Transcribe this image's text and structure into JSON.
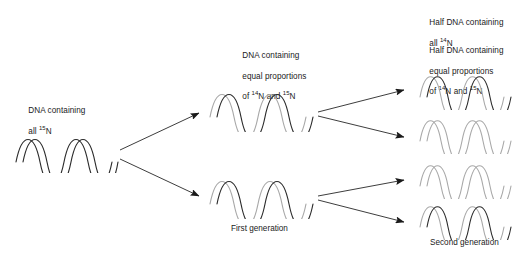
{
  "diagram": {
    "width": 528,
    "height": 259,
    "background": "#ffffff",
    "strand_colors": {
      "old_heavy_15n": "#2b2b2b",
      "new_light_14n": "#a8a8a8"
    }
  },
  "labels": {
    "parental": {
      "line1": "DNA containing",
      "line2_prefix": "all ",
      "line2_sup": "15",
      "line2_suffix": "N"
    },
    "first_generation_desc": {
      "line1": "DNA containing",
      "line2": "equal proportions",
      "line3_prefix": "of ",
      "line3_sup1": "14",
      "line3_mid": "N and ",
      "line3_sup2": "15",
      "line3_suffix": "N"
    },
    "second_generation_desc_a": {
      "line1": "Half DNA containing",
      "line2_prefix": "all ",
      "line2_sup": "14",
      "line2_suffix": "N"
    },
    "second_generation_desc_b": {
      "line1": "Half DNA containing",
      "line2": "equal proportions",
      "line3_prefix": "of ",
      "line3_sup1": "14",
      "line3_mid": "N and ",
      "line3_sup2": "15",
      "line3_suffix": "N"
    },
    "first_generation_caption": "First generation",
    "second_generation_caption": "Second generation"
  },
  "molecules": [
    {
      "id": "parental-dna",
      "name": "parental-dna-helix",
      "generation": "parental",
      "strands": [
        "old",
        "old"
      ],
      "composition": "all 15N"
    },
    {
      "id": "gen1-dna-top",
      "name": "first-generation-dna-upper",
      "generation": "first",
      "strands": [
        "new",
        "old"
      ],
      "composition": "equal proportions 14N and 15N"
    },
    {
      "id": "gen1-dna-bottom",
      "name": "first-generation-dna-lower",
      "generation": "first",
      "strands": [
        "new",
        "old"
      ],
      "composition": "equal proportions 14N and 15N"
    },
    {
      "id": "gen2-dna-1",
      "name": "second-generation-dna-1",
      "generation": "second",
      "strands": [
        "new",
        "old"
      ],
      "composition": "equal proportions 14N and 15N"
    },
    {
      "id": "gen2-dna-2",
      "name": "second-generation-dna-2",
      "generation": "second",
      "strands": [
        "new",
        "new"
      ],
      "composition": "all 14N"
    },
    {
      "id": "gen2-dna-3",
      "name": "second-generation-dna-3",
      "generation": "second",
      "strands": [
        "new",
        "new"
      ],
      "composition": "all 14N"
    },
    {
      "id": "gen2-dna-4",
      "name": "second-generation-dna-4",
      "generation": "second",
      "strands": [
        "new",
        "old"
      ],
      "composition": "equal proportions 14N and 15N"
    }
  ],
  "arrows": [
    {
      "id": "arrow-parent-to-gen1-top",
      "from": "parental-dna",
      "to": "gen1-dna-top"
    },
    {
      "id": "arrow-parent-to-gen1-bottom",
      "from": "parental-dna",
      "to": "gen1-dna-bottom"
    },
    {
      "id": "arrow-gen1top-to-gen2-1",
      "from": "gen1-dna-top",
      "to": "gen2-dna-1"
    },
    {
      "id": "arrow-gen1top-to-gen2-2",
      "from": "gen1-dna-top",
      "to": "gen2-dna-2"
    },
    {
      "id": "arrow-gen1bot-to-gen2-3",
      "from": "gen1-dna-bottom",
      "to": "gen2-dna-3"
    },
    {
      "id": "arrow-gen1bot-to-gen2-4",
      "from": "gen1-dna-bottom",
      "to": "gen2-dna-4"
    }
  ]
}
